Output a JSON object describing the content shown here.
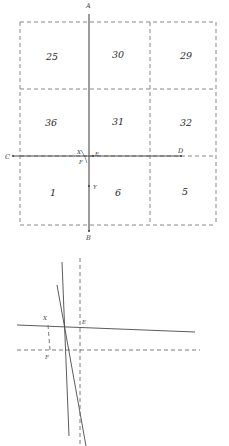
{
  "figure": {
    "title": "",
    "background": "#ffffff",
    "stroke_solid": "#4a4a4a",
    "stroke_dashed": "#6b6b6b",
    "text_color": "#2b2b2b"
  },
  "top_diagram": {
    "name": "grid-partition-diagram",
    "bounds": {
      "x": 20,
      "y": 22,
      "width": 196,
      "height": 203
    },
    "columns": [
      {
        "id": "col-left",
        "x0": 20,
        "x1": 89
      },
      {
        "id": "col-middle",
        "x0": 89,
        "x1": 150
      },
      {
        "id": "col-right",
        "x0": 150,
        "x1": 216
      }
    ],
    "rows": [
      {
        "id": "row-top",
        "y0": 22,
        "y1": 89
      },
      {
        "id": "row-middle",
        "y0": 89,
        "y1": 156
      },
      {
        "id": "row-bottom",
        "y0": 156,
        "y1": 225
      }
    ],
    "cells": [
      {
        "id": "cell-25",
        "label": "25",
        "x": 52,
        "y": 60
      },
      {
        "id": "cell-30",
        "label": "30",
        "x": 118,
        "y": 58
      },
      {
        "id": "cell-29",
        "label": "29",
        "x": 186,
        "y": 59
      },
      {
        "id": "cell-36",
        "label": "36",
        "x": 51,
        "y": 126
      },
      {
        "id": "cell-31",
        "label": "31",
        "x": 118,
        "y": 125
      },
      {
        "id": "cell-32",
        "label": "32",
        "x": 186,
        "y": 126
      },
      {
        "id": "cell-1",
        "label": "1",
        "x": 53,
        "y": 196
      },
      {
        "id": "cell-6",
        "label": "6",
        "x": 118,
        "y": 196
      },
      {
        "id": "cell-5",
        "label": "5",
        "x": 185,
        "y": 195
      }
    ],
    "axes": {
      "vertical_line": {
        "id": "axis-AB",
        "x": 89,
        "y_top": 14,
        "y_bottom": 231
      },
      "horizontal_line": {
        "id": "axis-CD",
        "y": 156,
        "x_left": 13,
        "x_right": 181
      }
    },
    "points": [
      {
        "id": "point-A",
        "label": "A",
        "x": 89,
        "y": 14,
        "label_x": 86,
        "label_y": 8
      },
      {
        "id": "point-B",
        "label": "B",
        "x": 89,
        "y": 231,
        "label_x": 86,
        "label_y": 240
      },
      {
        "id": "point-C",
        "label": "C",
        "x": 13,
        "y": 156,
        "label_x": 5,
        "label_y": 159
      },
      {
        "id": "point-D",
        "label": "D",
        "x": 181,
        "y": 156,
        "label_x": 178,
        "label_y": 153
      },
      {
        "id": "point-E",
        "label": "E",
        "x": 93,
        "y": 156,
        "label_x": 95,
        "label_y": 156
      },
      {
        "id": "point-X",
        "label": "X",
        "x": 83,
        "y": 153,
        "label_x": 77,
        "label_y": 154
      },
      {
        "id": "point-F",
        "label": "F",
        "x": 85,
        "y": 161,
        "label_x": 79,
        "label_y": 164
      },
      {
        "id": "point-Y",
        "label": "Y",
        "x": 89,
        "y": 186,
        "label_x": 93,
        "label_y": 189
      }
    ]
  },
  "bottom_diagram": {
    "name": "intersecting-lines-detail-diagram",
    "bounds": {
      "x": 17,
      "y": 258,
      "width": 183,
      "height": 188
    },
    "lines": [
      {
        "id": "steep-line-upper",
        "style": "solid",
        "x1": 62,
        "y1": 262,
        "x2": 69,
        "y2": 436
      },
      {
        "id": "steep-line-secondary",
        "style": "solid",
        "x1": 57,
        "y1": 285,
        "x2": 86,
        "y2": 446
      },
      {
        "id": "near-horizontal-line",
        "style": "solid",
        "x1": 17,
        "y1": 325,
        "x2": 195,
        "y2": 332
      },
      {
        "id": "vertical-dashed-line",
        "style": "dashed",
        "x1": 80,
        "y1": 258,
        "x2": 80,
        "y2": 446
      },
      {
        "id": "horizontal-dashed-line",
        "style": "dashed",
        "x1": 17,
        "y1": 350,
        "x2": 200,
        "y2": 350
      },
      {
        "id": "short-dashed-connector",
        "style": "dashed",
        "x1": 48,
        "y1": 325,
        "x2": 50,
        "y2": 350
      }
    ],
    "points": [
      {
        "id": "point-X-detail",
        "label": "X",
        "x": 48,
        "y": 324,
        "label_x": 43,
        "label_y": 320
      },
      {
        "id": "point-E-detail",
        "label": "E",
        "x": 80,
        "y": 327,
        "label_x": 82,
        "label_y": 324
      },
      {
        "id": "point-F-detail",
        "label": "F",
        "x": 50,
        "y": 350,
        "label_x": 45,
        "label_y": 359
      }
    ]
  }
}
